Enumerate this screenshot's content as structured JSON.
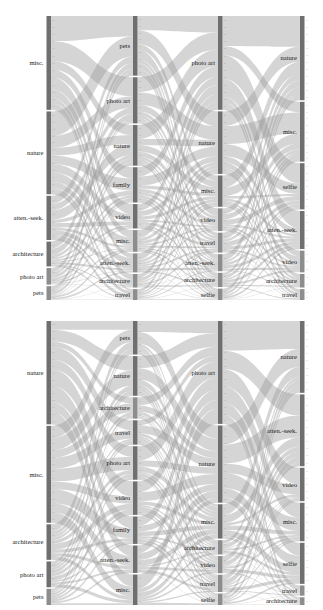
{
  "figure": {
    "type": "sankey-alluvial",
    "panels": 2,
    "background": "#ffffff",
    "flow_color": "#9a9a9a",
    "node_color": "#8d8d8d"
  },
  "chart_data": [
    {
      "id": "top",
      "type": "sankey",
      "title": "",
      "xlabel": "",
      "ylabel": "",
      "stages": [
        {
          "index": 0,
          "name": "stage-1-left",
          "nodes": [
            {
              "label": "misc.",
              "value": 34,
              "side": "left"
            },
            {
              "label": "nature",
              "value": 30,
              "side": "left"
            },
            {
              "label": "atten.-seek.",
              "value": 16,
              "side": "left"
            },
            {
              "label": "architecture",
              "value": 9,
              "side": "left"
            },
            {
              "label": "photo art",
              "value": 6,
              "side": "left"
            },
            {
              "label": "pets",
              "value": 5,
              "side": "left"
            }
          ]
        },
        {
          "index": 1,
          "name": "stage-2",
          "nodes": [
            {
              "label": "pets",
              "value": 22,
              "side": "right"
            },
            {
              "label": "photo art",
              "value": 17,
              "side": "right"
            },
            {
              "label": "nature",
              "value": 15,
              "side": "right"
            },
            {
              "label": "family",
              "value": 13,
              "side": "right"
            },
            {
              "label": "video",
              "value": 9,
              "side": "right"
            },
            {
              "label": "misc.",
              "value": 8,
              "side": "right"
            },
            {
              "label": "atten.-seek.",
              "value": 7,
              "side": "right"
            },
            {
              "label": "architecture",
              "value": 5,
              "side": "right"
            },
            {
              "label": "travel",
              "value": 4,
              "side": "right"
            }
          ]
        },
        {
          "index": 2,
          "name": "stage-3",
          "nodes": [
            {
              "label": "photo art",
              "value": 33,
              "side": "right"
            },
            {
              "label": "nature",
              "value": 22,
              "side": "right"
            },
            {
              "label": "misc.",
              "value": 11,
              "side": "right"
            },
            {
              "label": "video",
              "value": 8,
              "side": "right"
            },
            {
              "label": "travel",
              "value": 7,
              "side": "right"
            },
            {
              "label": "atten.-seek.",
              "value": 6,
              "side": "right"
            },
            {
              "label": "architecture",
              "value": 5,
              "side": "right"
            },
            {
              "label": "selfie",
              "value": 4,
              "side": "right"
            }
          ]
        },
        {
          "index": 3,
          "name": "stage-4-right",
          "nodes": [
            {
              "label": "nature",
              "value": 31,
              "side": "right"
            },
            {
              "label": "misc.",
              "value": 22,
              "side": "right"
            },
            {
              "label": "selfie",
              "value": 17,
              "side": "right"
            },
            {
              "label": "atten.-seek.",
              "value": 14,
              "side": "right"
            },
            {
              "label": "video",
              "value": 8,
              "side": "right"
            },
            {
              "label": "architecture",
              "value": 5,
              "side": "right"
            },
            {
              "label": "travel",
              "value": 4,
              "side": "right"
            }
          ]
        }
      ]
    },
    {
      "id": "bottom",
      "type": "sankey",
      "title": "",
      "xlabel": "",
      "ylabel": "",
      "stages": [
        {
          "index": 0,
          "name": "stage-1-left",
          "nodes": [
            {
              "label": "nature",
              "value": 32,
              "side": "left"
            },
            {
              "label": "misc.",
              "value": 30,
              "side": "left"
            },
            {
              "label": "architecture",
              "value": 11,
              "side": "left"
            },
            {
              "label": "photo art",
              "value": 8,
              "side": "left"
            },
            {
              "label": "pets",
              "value": 5,
              "side": "left"
            }
          ]
        },
        {
          "index": 1,
          "name": "stage-2",
          "nodes": [
            {
              "label": "pets",
              "value": 11,
              "side": "right"
            },
            {
              "label": "nature",
              "value": 13,
              "side": "right"
            },
            {
              "label": "architecture",
              "value": 7,
              "side": "right"
            },
            {
              "label": "travel",
              "value": 8,
              "side": "right"
            },
            {
              "label": "photo art",
              "value": 11,
              "side": "right"
            },
            {
              "label": "video",
              "value": 11,
              "side": "right"
            },
            {
              "label": "family",
              "value": 9,
              "side": "right"
            },
            {
              "label": "atten.-seek.",
              "value": 9,
              "side": "right"
            },
            {
              "label": "misc.",
              "value": 10,
              "side": "right"
            }
          ]
        },
        {
          "index": 2,
          "name": "stage-3",
          "nodes": [
            {
              "label": "photo art",
              "value": 36,
              "side": "right"
            },
            {
              "label": "nature",
              "value": 27,
              "side": "right"
            },
            {
              "label": "misc.",
              "value": 12,
              "side": "right"
            },
            {
              "label": "architecture",
              "value": 5,
              "side": "right"
            },
            {
              "label": "video",
              "value": 6,
              "side": "right"
            },
            {
              "label": "travel",
              "value": 6,
              "side": "right"
            },
            {
              "label": "selfie",
              "value": 4,
              "side": "right"
            }
          ]
        },
        {
          "index": 3,
          "name": "stage-4-right",
          "nodes": [
            {
              "label": "nature",
              "value": 28,
              "side": "right"
            },
            {
              "label": "atten.-seek.",
              "value": 28,
              "side": "right"
            },
            {
              "label": "video",
              "value": 13,
              "side": "right"
            },
            {
              "label": "misc.",
              "value": 15,
              "side": "right"
            },
            {
              "label": "selfie",
              "value": 16,
              "side": "right"
            },
            {
              "label": "travel",
              "value": 4,
              "side": "right"
            },
            {
              "label": "architecture",
              "value": 3,
              "side": "right"
            }
          ]
        }
      ]
    }
  ]
}
